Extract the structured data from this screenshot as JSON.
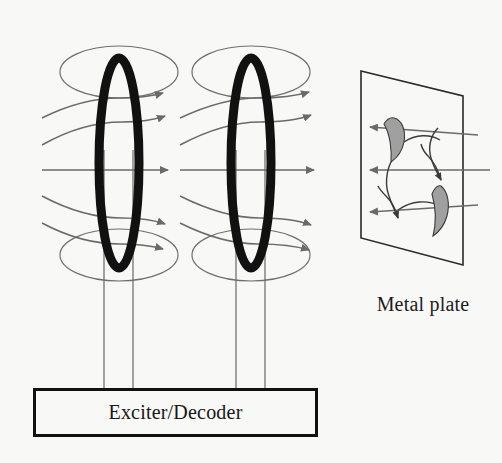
{
  "figure": {
    "background_color": "#f8f8f7",
    "ink_color": "#161616",
    "field_line_color": "#6a6a6a",
    "eddy_fill_color": "#a0a0a0"
  },
  "labels": {
    "exciter_box": "Exciter/Decoder",
    "metal_plate": "Metal plate"
  },
  "components": {
    "coils": [
      {
        "name": "coil-1",
        "center_x": 119,
        "center_y": 163,
        "rx": 20,
        "ry": 105,
        "stroke_width": 9,
        "color": "#111111",
        "lead_wire_x": [
          104,
          133
        ],
        "lead_wire_bottom_y": 388,
        "flux_ellipse_top": {
          "cx": 119,
          "cy": 72,
          "rx": 59,
          "ry": 26
        },
        "flux_ellipse_bottom": {
          "cx": 119,
          "cy": 255,
          "rx": 59,
          "ry": 26
        }
      },
      {
        "name": "coil-2",
        "center_x": 251,
        "center_y": 163,
        "rx": 20,
        "ry": 105,
        "stroke_width": 9,
        "color": "#111111",
        "lead_wire_x": [
          236,
          265
        ],
        "lead_wire_bottom_y": 388,
        "flux_ellipse_top": {
          "cx": 251,
          "cy": 72,
          "rx": 59,
          "ry": 26
        },
        "flux_ellipse_bottom": {
          "cx": 251,
          "cy": 255,
          "rx": 59,
          "ry": 26
        }
      }
    ],
    "field_lines": {
      "count_per_coil": 5,
      "arrow_color": "#6a6a6a",
      "y_levels": [
        105,
        134,
        163,
        192,
        221
      ]
    },
    "metal_plate": {
      "corners": [
        [
          361,
          71
        ],
        [
          463,
          96
        ],
        [
          463,
          265
        ],
        [
          361,
          238
        ]
      ],
      "stroke": "#2a2a2a",
      "fill": "#f8f8f7"
    },
    "eddy_currents": {
      "loop_count": 2,
      "fill": "#a0a0a0",
      "stroke": "#3a3a3a"
    },
    "return_arrows": {
      "count": 3,
      "direction": "left",
      "tip_x": 370,
      "y_levels": [
        127,
        163,
        200
      ]
    },
    "exciter_box": {
      "x": 33,
      "y": 388,
      "width": 285,
      "height": 49,
      "border_color": "#111111"
    }
  }
}
